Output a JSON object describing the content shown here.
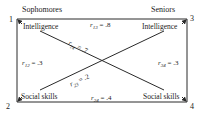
{
  "headers": {
    "left": "Sophomores",
    "right": "Seniors"
  },
  "nodes": [
    {
      "id": "1",
      "label": "Intelligence",
      "group": "Sophomores"
    },
    {
      "id": "2",
      "label": "Social skills",
      "group": "Sophomores"
    },
    {
      "id": "3",
      "label": "Intelligence",
      "group": "Seniors"
    },
    {
      "id": "4",
      "label": "Social skills",
      "group": "Seniors"
    }
  ],
  "correlations": [
    {
      "from": "1",
      "to": "3",
      "sym": "r",
      "sub": "13",
      "value": " = .8"
    },
    {
      "from": "1",
      "to": "2",
      "sym": "r",
      "sub": "12",
      "value": " = .3"
    },
    {
      "from": "3",
      "to": "4",
      "sym": "r",
      "sub": "34",
      "value": " = .3"
    },
    {
      "from": "2",
      "to": "4",
      "sym": "r",
      "sub": "24",
      "value": " = .4"
    },
    {
      "from": "1",
      "to": "4",
      "sym": "r",
      "sub": "14",
      "value": " = .7"
    },
    {
      "from": "2",
      "to": "3",
      "sym": "r",
      "sub": "23",
      "value": " = .2"
    }
  ],
  "colors": {
    "line": "#2a2a2a",
    "text": "#222222"
  }
}
